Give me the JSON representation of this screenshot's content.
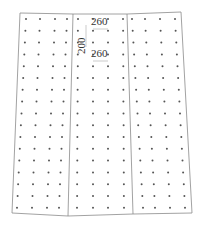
{
  "diagram": {
    "type": "dot-grid-plan",
    "stroke_color": "#8a8a8a",
    "dot_color": "#555555",
    "outline": [
      [
        20,
        13
      ],
      [
        73,
        14
      ],
      [
        127,
        14
      ],
      [
        181,
        12
      ],
      [
        192,
        213
      ],
      [
        133,
        214
      ],
      [
        68,
        216
      ],
      [
        12,
        213
      ]
    ],
    "dividers": [
      {
        "top": [
          73,
          14
        ],
        "bottom": [
          68,
          216
        ]
      },
      {
        "top": [
          127,
          14
        ],
        "bottom": [
          133,
          214
        ]
      }
    ],
    "panels": [
      {
        "name": "left",
        "columns": 4,
        "top_x": [
          26,
          40,
          55,
          67
        ],
        "bottom_x": [
          17,
          32,
          47,
          59
        ]
      },
      {
        "name": "middle",
        "columns": 4,
        "top_x": [
          78,
          93,
          108,
          123
        ],
        "bottom_x": [
          77,
          93,
          108,
          124
        ]
      },
      {
        "name": "right",
        "columns": 4,
        "top_x": [
          132,
          145,
          160,
          175
        ],
        "bottom_x": [
          143,
          155,
          170,
          185
        ]
      }
    ],
    "rows": {
      "count": 17,
      "first_y": 19,
      "spacing": 11.8
    },
    "dimensions": [
      {
        "label": "260",
        "x": 91,
        "y": 22,
        "orientation": "horizontal"
      },
      {
        "label": "200",
        "x": 76,
        "y": 48,
        "orientation": "vertical"
      },
      {
        "label": "260",
        "x": 91,
        "y": 54,
        "orientation": "horizontal"
      }
    ]
  }
}
